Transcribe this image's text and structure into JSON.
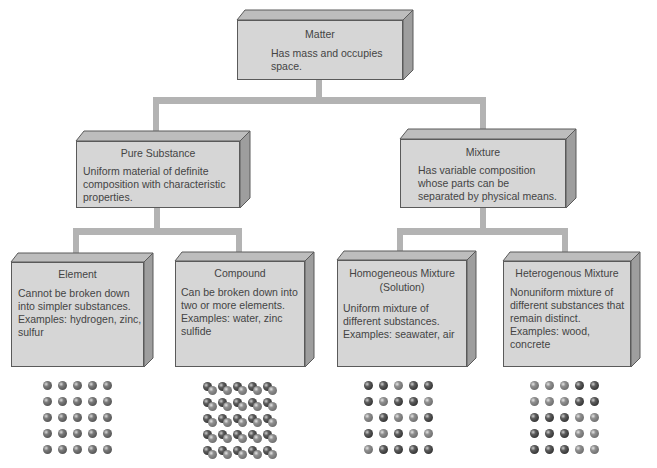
{
  "diagram": {
    "type": "classification-tree",
    "colors": {
      "box_face": "#d6d6d6",
      "box_side": "#9e9e9e",
      "box_top": "#bdbdbd",
      "connector": "#b3b3b3",
      "outline": "#5a5a5a"
    },
    "root": {
      "title": "Matter",
      "description": "Has mass and occupies space."
    },
    "level2": [
      {
        "title": "Pure Substance",
        "description": "Uniform material of definite composition with characteristic properties."
      },
      {
        "title": "Mixture",
        "description": "Has variable composition whose parts can be separated by physical means."
      }
    ],
    "level3": [
      {
        "title": "Element",
        "description": "Cannot be broken down into simpler substances. Examples: hydrogen, zinc, sulfur",
        "particles": "uniform single-atom grid 5x5"
      },
      {
        "title": "Compound",
        "description": "Can be broken down into two or more elements. Examples: water, zinc sulfide",
        "particles": "paired dark+light molecules grid 5x5"
      },
      {
        "title": "Homogeneous Mixture",
        "subtitle": "(Solution)",
        "description": "Uniform mixture of different substances. Examples: seawater, air",
        "particles": "randomly interspersed dark/light atoms grid 5x5"
      },
      {
        "title": "Heterogenous Mixture",
        "description": "Nonuniform mixture of different substances that remain distinct. Examples: wood, concrete",
        "particles": "separated regions of dark/light atoms grid 5x5"
      }
    ]
  }
}
